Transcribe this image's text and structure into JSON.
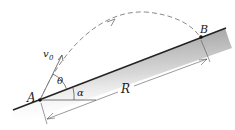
{
  "diagram": {
    "labels": {
      "point_a": "A",
      "point_b": "B",
      "initial_velocity": "v",
      "initial_velocity_sub": "0",
      "launch_angle": "θ",
      "incline_angle": "α",
      "range": "R"
    },
    "colors": {
      "ink": "#222222",
      "trajectory": "#8a8a8a",
      "incline_shade": "#9a9a9a"
    }
  }
}
